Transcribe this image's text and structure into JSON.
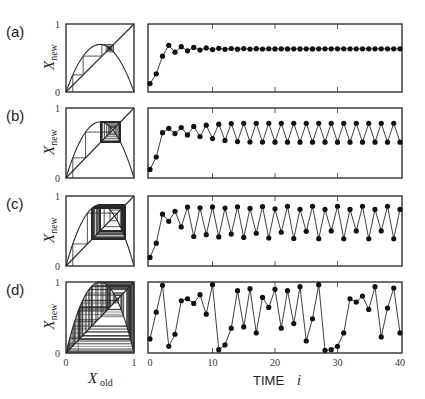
{
  "chart_data": [
    {
      "id": "a",
      "panel_label": "(a)",
      "type": "line",
      "description": "Cobweb plot + time series converging to fixed point",
      "map_parameter_r": 2.8,
      "x0": 0.1,
      "cobweb": {
        "xlabel": "",
        "ylabel": "X_new",
        "xlim": [
          0,
          1
        ],
        "ylim": [
          0,
          1
        ],
        "yticks": [
          "0",
          "1"
        ]
      },
      "series": {
        "x": "0..40",
        "approx_values": [
          0.1,
          0.25,
          0.53,
          0.7,
          0.59,
          0.68,
          0.61,
          0.66,
          0.63,
          0.65,
          0.64,
          0.64,
          0.64
        ],
        "steady_state": 0.64
      },
      "xlim": [
        0,
        40
      ],
      "ylim": [
        0,
        1
      ]
    },
    {
      "id": "b",
      "panel_label": "(b)",
      "type": "line",
      "description": "Period-2 oscillation",
      "map_parameter_r": 3.2,
      "x0": 0.1,
      "cobweb": {
        "xlabel": "",
        "ylabel": "X_new",
        "xlim": [
          0,
          1
        ],
        "ylim": [
          0,
          1
        ],
        "yticks": [
          "0",
          "1"
        ]
      },
      "series": {
        "x": "0..40",
        "approx_values": [
          0.1,
          0.29,
          0.66,
          0.72,
          0.65,
          0.73,
          0.63,
          0.75,
          0.6,
          0.77,
          0.57,
          0.78,
          0.54,
          0.8,
          0.51
        ],
        "cycle": [
          0.8,
          0.51
        ]
      },
      "xlim": [
        0,
        40
      ],
      "ylim": [
        0,
        1
      ]
    },
    {
      "id": "c",
      "panel_label": "(c)",
      "type": "line",
      "description": "Period-4 oscillation",
      "map_parameter_r": 3.5,
      "x0": 0.1,
      "cobweb": {
        "xlabel": "",
        "ylabel": "X_new",
        "xlim": [
          0,
          1
        ],
        "ylim": [
          0,
          1
        ],
        "yticks": [
          "0",
          "1"
        ]
      },
      "series": {
        "x": "0..40",
        "approx_values": [
          0.1,
          0.32,
          0.76,
          0.64,
          0.81,
          0.54,
          0.87,
          0.4,
          0.84,
          0.47,
          0.87,
          0.39
        ],
        "cycle": [
          0.87,
          0.38,
          0.83,
          0.5
        ]
      },
      "xlim": [
        0,
        40
      ],
      "ylim": [
        0,
        1
      ]
    },
    {
      "id": "d",
      "panel_label": "(d)",
      "type": "line",
      "description": "Chaotic behaviour",
      "map_parameter_r": 4.0,
      "x0": 0.18,
      "cobweb": {
        "xlabel": "X_old",
        "ylabel": "X_new",
        "xlim": [
          0,
          1
        ],
        "ylim": [
          0,
          1
        ],
        "xticks": [
          "0",
          "1"
        ],
        "yticks": [
          "0",
          "1"
        ]
      },
      "series": {
        "x": [
          0,
          1,
          2,
          3,
          4,
          5,
          6,
          7,
          8,
          9,
          10,
          11,
          12,
          13,
          14,
          15,
          16,
          17,
          18,
          19,
          20,
          21,
          22,
          23,
          24,
          25,
          26,
          27,
          28,
          29,
          30,
          31,
          32,
          33,
          34,
          35,
          36,
          37,
          38,
          39,
          40
        ],
        "values": [
          0.18,
          0.58,
          0.98,
          0.07,
          0.25,
          0.75,
          0.78,
          0.71,
          0.84,
          0.55,
          0.99,
          0.02,
          0.09,
          0.34,
          0.9,
          0.36,
          0.93,
          0.27,
          0.8,
          0.65,
          0.92,
          0.34,
          0.9,
          0.41,
          0.96,
          0.15,
          0.48,
          0.99,
          0.01,
          0.02,
          0.07,
          0.27,
          0.78,
          0.73,
          0.82,
          0.62,
          0.96,
          0.21,
          0.64,
          0.94,
          0.27
        ]
      },
      "xlim": [
        0,
        40
      ],
      "ylim": [
        0,
        1
      ]
    }
  ],
  "labels": {
    "panel_a": "(a)",
    "panel_b": "(b)",
    "panel_c": "(c)",
    "panel_d": "(d)",
    "y_axis_var": "X",
    "y_axis_sub": "new",
    "x_axis_var": "X",
    "x_axis_sub": "old",
    "tick_zero": "0",
    "tick_one": "1",
    "time_label": "TIME",
    "time_var": "i",
    "time_ticks": [
      "0",
      "10",
      "20",
      "30",
      "40"
    ]
  },
  "colors": {
    "line": "#2a2a2a",
    "frame": "#333333",
    "marker": "#111111",
    "background": "#ffffff"
  }
}
